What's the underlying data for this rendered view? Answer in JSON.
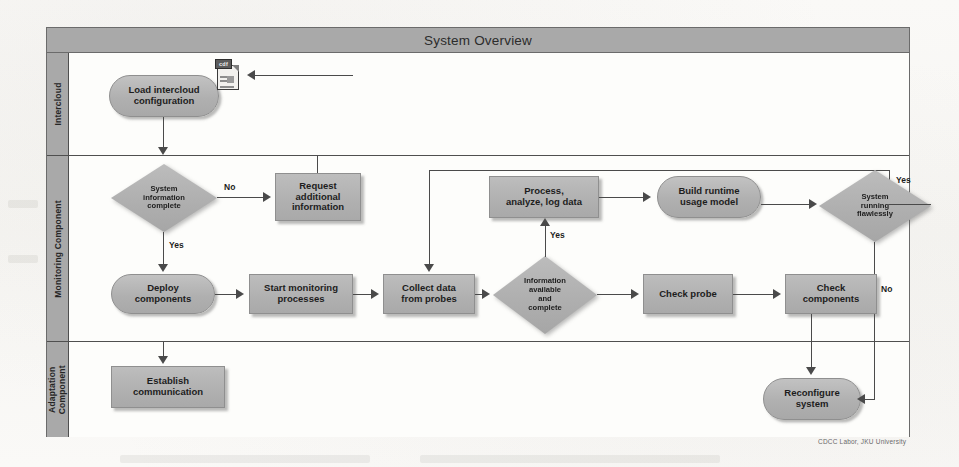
{
  "page": {
    "credit": "CDCC Labor, JKU University"
  },
  "diagram": {
    "title": "System Overview",
    "type": "flowchart-swimlane",
    "lanes": [
      {
        "id": "intercloud",
        "label": "Intercloud"
      },
      {
        "id": "monitoring",
        "label": "Monitoring Component"
      },
      {
        "id": "adaptation",
        "label": "Adaptation\nComponent"
      }
    ],
    "nodes": [
      {
        "id": "load-intercloud-configuration",
        "label": "Load intercloud\nconfiguration",
        "shape": "rounded",
        "lane": "intercloud"
      },
      {
        "id": "config-document",
        "label": "cdf",
        "shape": "document-icon",
        "lane": "intercloud"
      },
      {
        "id": "system-information-complete",
        "label": "System\ninformation\ncomplete",
        "shape": "diamond",
        "lane": "monitoring"
      },
      {
        "id": "request-additional-information",
        "label": "Request\nadditional\ninformation",
        "shape": "rect",
        "lane": "monitoring"
      },
      {
        "id": "deploy-components",
        "label": "Deploy\ncomponents",
        "shape": "rounded",
        "lane": "monitoring"
      },
      {
        "id": "start-monitoring-processes",
        "label": "Start monitoring\nprocesses",
        "shape": "rect",
        "lane": "monitoring"
      },
      {
        "id": "collect-data-from-probes",
        "label": "Collect data\nfrom probes",
        "shape": "rect",
        "lane": "monitoring"
      },
      {
        "id": "information-available-and-complete",
        "label": "Information\navailable\nand\ncomplete",
        "shape": "diamond",
        "lane": "monitoring"
      },
      {
        "id": "process-analyze-log-data",
        "label": "Process,\nanalyze, log data",
        "shape": "rect",
        "lane": "monitoring"
      },
      {
        "id": "build-runtime-usage-model",
        "label": "Build runtime\nusage model",
        "shape": "rounded",
        "lane": "monitoring"
      },
      {
        "id": "system-running-flawlessly",
        "label": "System\nrunning\nflawlessly",
        "shape": "diamond",
        "lane": "monitoring"
      },
      {
        "id": "check-probe",
        "label": "Check probe",
        "shape": "rect",
        "lane": "monitoring"
      },
      {
        "id": "check-components",
        "label": "Check\ncomponents",
        "shape": "rect",
        "lane": "monitoring"
      },
      {
        "id": "establish-communication",
        "label": "Establish\ncommunication",
        "shape": "rect",
        "lane": "adaptation"
      },
      {
        "id": "reconfigure-system",
        "label": "Reconfigure\nsystem",
        "shape": "rounded",
        "lane": "adaptation"
      }
    ],
    "edge_labels": {
      "system_info_no": "No",
      "system_info_yes": "Yes",
      "information_available_yes": "Yes",
      "system_running_yes": "Yes",
      "system_running_no": "No"
    },
    "colors": {
      "node_fill": "#b3b3b3",
      "lane_header_fill": "#a9a9a9",
      "title_bar_fill": "#a9a9a9",
      "connector": "#4a4a4a",
      "frame_border": "#6b6b6b",
      "canvas": "#fdfcfa"
    }
  }
}
